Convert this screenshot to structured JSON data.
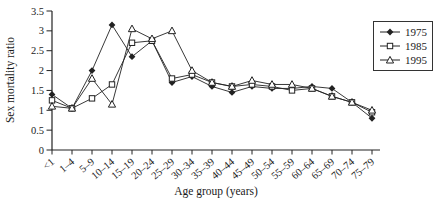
{
  "figure": {
    "background": "#ffffff",
    "line_color": "#222222",
    "text_color": "#1a1a1a"
  },
  "chart_data": {
    "type": "line",
    "title": "",
    "xlabel": "Age group (years)",
    "ylabel": "Sex mortality ratio",
    "categories": [
      "<1",
      "1–4",
      "5–9",
      "10–14",
      "15–19",
      "20–24",
      "25–29",
      "30–34",
      "35–39",
      "40–44",
      "45–49",
      "50–54",
      "55–59",
      "60–64",
      "65–69",
      "70–74",
      "75–79"
    ],
    "yticks": [
      0,
      0.5,
      1,
      1.5,
      2,
      2.5,
      3,
      3.5
    ],
    "ylim": [
      0,
      3.5
    ],
    "grid": false,
    "legend_position": "top-right",
    "series": [
      {
        "name": "1975",
        "marker": "filled-diamond",
        "values": [
          1.4,
          1.05,
          2.0,
          3.15,
          2.35,
          2.75,
          1.7,
          1.85,
          1.6,
          1.45,
          1.6,
          1.55,
          1.55,
          1.6,
          1.55,
          1.2,
          0.8
        ]
      },
      {
        "name": "1985",
        "marker": "open-square",
        "values": [
          1.25,
          1.05,
          1.3,
          1.65,
          2.7,
          2.75,
          1.8,
          1.9,
          1.7,
          1.6,
          1.65,
          1.6,
          1.5,
          1.55,
          1.35,
          1.2,
          0.95
        ]
      },
      {
        "name": "1995",
        "marker": "open-triangle",
        "values": [
          1.1,
          1.05,
          1.8,
          1.15,
          3.05,
          2.8,
          3.0,
          2.0,
          1.7,
          1.6,
          1.75,
          1.65,
          1.65,
          1.55,
          1.35,
          1.2,
          1.0
        ]
      }
    ]
  }
}
